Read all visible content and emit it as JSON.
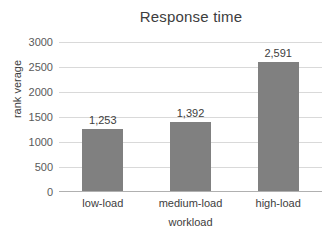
{
  "chart_data": {
    "type": "bar",
    "title": "Response time",
    "xlabel": "workload",
    "ylabel": "rank verage",
    "categories": [
      "low-load",
      "medium-load",
      "high-load"
    ],
    "values": [
      1253,
      1392,
      2591
    ],
    "value_labels": [
      "1,253",
      "1,392",
      "2,591"
    ],
    "ylim": [
      0,
      3000
    ],
    "yticks": [
      0,
      500,
      1000,
      1500,
      2000,
      2500,
      3000
    ],
    "ytick_labels": [
      "0",
      "500",
      "1000",
      "1500",
      "2000",
      "2500",
      "3000"
    ],
    "grid": true,
    "legend": false,
    "bar_color": "#808080",
    "gridline_color": "#d9d9d9",
    "background_color": "#ffffff",
    "text_color": "#3d3d3d"
  }
}
